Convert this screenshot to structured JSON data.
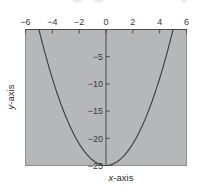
{
  "chart_data": {
    "type": "line",
    "title": "",
    "subtitle": "",
    "xlabel": "x-axis",
    "ylabel": "y-axis",
    "xlim": [
      -6,
      6
    ],
    "ylim": [
      -25,
      0
    ],
    "grid": false,
    "legend": null,
    "function": "y = x^2 - 25",
    "xticks": [
      -6,
      -4,
      -2,
      0,
      2,
      4,
      6
    ],
    "xtick_labels": [
      "−6",
      "−4",
      "−2",
      "0",
      "2",
      "4",
      "6"
    ],
    "yticks": [
      -5,
      -10,
      -15,
      -20,
      -25
    ],
    "ytick_labels": [
      "−5",
      "−10",
      "−15",
      "−20",
      "−25"
    ],
    "x_axis_position": "top",
    "y_axis_position": "center",
    "plot_background_color": "#b6b7b9",
    "curve_color": "#3c3c3c",
    "axis_color": "#4a4a4a",
    "series": [
      {
        "name": "y = x^2 - 25",
        "x": [
          -5.0,
          -4.8,
          -4.6,
          -4.4,
          -4.2,
          -4.0,
          -3.8,
          -3.6,
          -3.4,
          -3.2,
          -3.0,
          -2.8,
          -2.6,
          -2.4,
          -2.2,
          -2.0,
          -1.8,
          -1.6,
          -1.4,
          -1.2,
          -1.0,
          -0.8,
          -0.6,
          -0.4,
          -0.2,
          0.0,
          0.2,
          0.4,
          0.6,
          0.8,
          1.0,
          1.2,
          1.4,
          1.6,
          1.8,
          2.0,
          2.2,
          2.4,
          2.6,
          2.8,
          3.0,
          3.2,
          3.4,
          3.6,
          3.8,
          4.0,
          4.2,
          4.4,
          4.6,
          4.8,
          5.0
        ],
        "y": [
          0.0,
          -1.96,
          -3.84,
          -5.64,
          -7.36,
          -9.0,
          -10.56,
          -12.04,
          -13.44,
          -14.76,
          -16.0,
          -17.16,
          -18.24,
          -19.24,
          -20.16,
          -21.0,
          -21.76,
          -22.44,
          -23.04,
          -23.56,
          -24.0,
          -24.36,
          -24.64,
          -24.84,
          -24.96,
          -25.0,
          -24.96,
          -24.84,
          -24.64,
          -24.36,
          -24.0,
          -23.56,
          -23.04,
          -22.44,
          -21.76,
          -21.0,
          -20.16,
          -19.24,
          -18.24,
          -17.16,
          -16.0,
          -14.76,
          -13.44,
          -12.04,
          -10.56,
          -9.0,
          -7.36,
          -5.64,
          -3.84,
          -1.96,
          0.0
        ]
      }
    ]
  },
  "labels": {
    "x_axis_title_italic": "x",
    "x_axis_title_rest": "-axis",
    "y_axis_title_italic": "y",
    "y_axis_title_rest": "-axis"
  }
}
